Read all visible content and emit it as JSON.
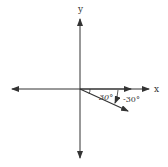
{
  "diagram": {
    "axes": {
      "x_label": "x",
      "y_label": "y"
    },
    "vector": {
      "angle_label_positive": "30°",
      "angle_label_negative": "-30°",
      "angle_degrees": -30
    },
    "colors": {
      "stroke": "#333333",
      "background": "#ffffff"
    }
  }
}
